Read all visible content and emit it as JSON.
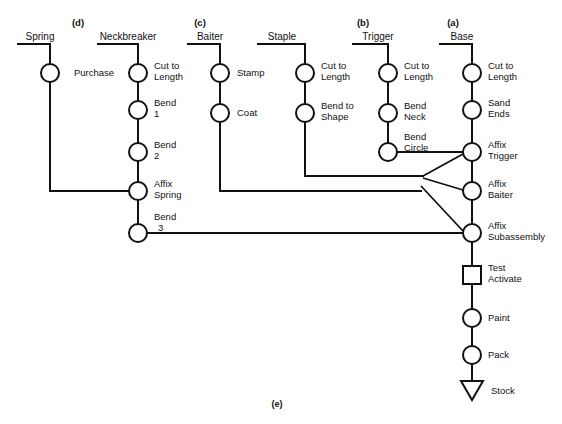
{
  "figure": {
    "caption": "(e)",
    "type": "assembly-process-chart"
  },
  "columns": [
    {
      "id": "spring",
      "group_tag": "(d)",
      "group_tag_x": 78,
      "header": "Spring",
      "header_x": 40,
      "axis_x": 50,
      "bar_x1": 18,
      "bar_x2": 50,
      "bar_y": 44,
      "operations": [
        {
          "label": "Purchase",
          "label_lines": [
            "Purchase"
          ],
          "shape": "circle",
          "x": 50,
          "y": 73
        }
      ]
    },
    {
      "id": "neckbreaker",
      "group_tag": "",
      "group_tag_x": 0,
      "header": "Neckbreaker",
      "header_x": 128,
      "axis_x": 138,
      "bar_x1": 98,
      "bar_x2": 138,
      "bar_y": 44,
      "operations": [
        {
          "label": "Cut to Length",
          "label_lines": [
            "Cut to",
            "Length"
          ],
          "shape": "circle",
          "x": 138,
          "y": 73
        },
        {
          "label": "Bend 1",
          "label_lines": [
            "Bend",
            "1"
          ],
          "shape": "circle",
          "x": 138,
          "y": 110
        },
        {
          "label": "Bend 2",
          "label_lines": [
            "Bend",
            "2"
          ],
          "shape": "circle",
          "x": 138,
          "y": 152
        },
        {
          "label": "Affix Spring",
          "label_lines": [
            "Affix",
            "Spring"
          ],
          "shape": "circle",
          "x": 138,
          "y": 191
        },
        {
          "label": "Bend 3",
          "label_lines": [
            "Bend",
            "3"
          ],
          "shape": "circle",
          "x": 138,
          "y": 233
        }
      ]
    },
    {
      "id": "baiter",
      "group_tag": "(c)",
      "group_tag_x": 200,
      "header": "Baiter",
      "header_x": 210,
      "axis_x": 220,
      "bar_x1": 188,
      "bar_x2": 220,
      "bar_y": 44,
      "operations": [
        {
          "label": "Stamp",
          "label_lines": [
            "Stamp"
          ],
          "shape": "circle",
          "x": 220,
          "y": 73
        },
        {
          "label": "Coat",
          "label_lines": [
            "Coat"
          ],
          "shape": "circle",
          "x": 220,
          "y": 113
        }
      ]
    },
    {
      "id": "staple",
      "group_tag": "",
      "group_tag_x": 0,
      "header": "Staple",
      "header_x": 272,
      "axis_x": 305,
      "bar_x1": 258,
      "bar_x2": 305,
      "bar_y": 44,
      "operations": [
        {
          "label": "Cut to Length",
          "label_lines": [
            "Cut to",
            "Length"
          ],
          "shape": "circle",
          "x": 305,
          "y": 73
        },
        {
          "label": "Bend to Shape",
          "label_lines": [
            "Bend to",
            "Shape"
          ],
          "shape": "circle",
          "x": 305,
          "y": 113
        }
      ]
    },
    {
      "id": "trigger",
      "group_tag": "(b)",
      "group_tag_x": 363,
      "header": "Trigger",
      "header_x": 378,
      "axis_x": 388,
      "bar_x1": 353,
      "bar_x2": 388,
      "bar_y": 44,
      "operations": [
        {
          "label": "Cut to Length",
          "label_lines": [
            "Cut to",
            "Length"
          ],
          "shape": "circle",
          "x": 388,
          "y": 73
        },
        {
          "label": "Bend Neck",
          "label_lines": [
            "Bend",
            "Neck"
          ],
          "shape": "circle",
          "x": 388,
          "y": 113
        },
        {
          "label": "Bend Circle",
          "label_lines": [
            "Bend",
            "Circle"
          ],
          "shape": "circle",
          "x": 388,
          "y": 152
        }
      ]
    },
    {
      "id": "base",
      "group_tag": "(a)",
      "group_tag_x": 453,
      "header": "Base",
      "header_x": 462,
      "axis_x": 472,
      "bar_x1": 440,
      "bar_x2": 472,
      "bar_y": 44,
      "operations": [
        {
          "label": "Cut to Length",
          "label_lines": [
            "Cut to",
            "Length"
          ],
          "shape": "circle",
          "x": 472,
          "y": 73
        },
        {
          "label": "Sand Ends",
          "label_lines": [
            "Sand",
            "Ends"
          ],
          "shape": "circle",
          "x": 472,
          "y": 110
        },
        {
          "label": "Affix Trigger",
          "label_lines": [
            "Affix",
            "Trigger"
          ],
          "shape": "circle",
          "x": 472,
          "y": 152
        },
        {
          "label": "Affix Baiter",
          "label_lines": [
            "Affix",
            "Baiter"
          ],
          "shape": "circle",
          "x": 472,
          "y": 191
        },
        {
          "label": "Affix Subassembly",
          "label_lines": [
            "Affix",
            "Subassembly"
          ],
          "shape": "circle",
          "x": 472,
          "y": 233
        },
        {
          "label": "Test Activate",
          "label_lines": [
            "Test",
            "Activate"
          ],
          "shape": "square",
          "x": 472,
          "y": 275
        },
        {
          "label": "Paint",
          "label_lines": [
            "Paint"
          ],
          "shape": "circle",
          "x": 472,
          "y": 318
        },
        {
          "label": "Pack",
          "label_lines": [
            "Pack"
          ],
          "shape": "circle",
          "x": 472,
          "y": 355
        },
        {
          "label": "Stock",
          "label_lines": [
            "Stock"
          ],
          "shape": "triangle",
          "x": 472,
          "y": 391
        }
      ]
    }
  ],
  "style": {
    "line_color": "#111111",
    "node_fill": "#ffffff",
    "background": "#ffffff",
    "node_radius": 9
  }
}
